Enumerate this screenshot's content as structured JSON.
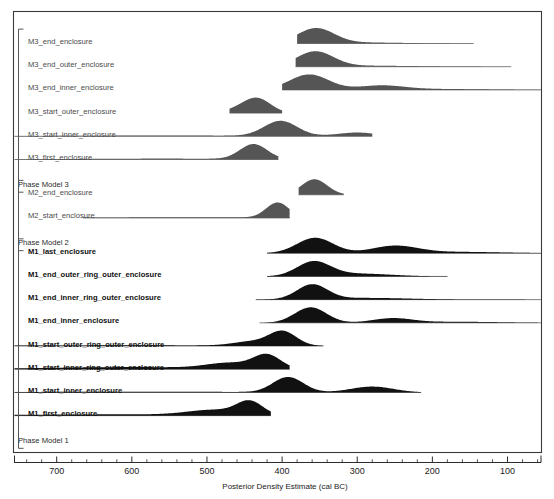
{
  "figure": {
    "width": 554,
    "height": 499,
    "background": "#ffffff"
  },
  "axis_title": "Posterior Density Estimate (cal BC)",
  "chart_data": {
    "type": "area",
    "title": "",
    "subtitle": "",
    "xlabel": "Posterior Density Estimate (cal BC)",
    "ylabel": "",
    "grid": false,
    "legend": null,
    "x_axis": {
      "label": "Posterior Density Estimate (cal BC)",
      "reversed": true,
      "xlim": [
        760,
        45
      ],
      "tick_labels": [
        "700",
        "600",
        "500",
        "400",
        "300",
        "200",
        "100"
      ],
      "tick_values": [
        700,
        600,
        500,
        400,
        300,
        200,
        100
      ],
      "minor_tick_interval": 20,
      "units": "cal BC"
    },
    "groups": [
      {
        "group_label": "Phase Model 3",
        "group_id": "phase-model-3",
        "ink": "#555555",
        "rows": [
          {
            "label": "M3_end_enclosure",
            "range": [
              380,
              145
            ],
            "modes": [
              {
                "center": 355,
                "height": 1.0,
                "width": 24
              },
              {
                "center": 300,
                "height": 0.07,
                "width": 60
              }
            ]
          },
          {
            "label": "M3_end_outer_enclosure",
            "range": [
              382,
              95
            ],
            "modes": [
              {
                "center": 356,
                "height": 1.0,
                "width": 24
              },
              {
                "center": 295,
                "height": 0.07,
                "width": 70
              }
            ]
          },
          {
            "label": "M3_end_inner_enclosure",
            "range": [
              400,
              40
            ],
            "modes": [
              {
                "center": 364,
                "height": 1.0,
                "width": 26
              },
              {
                "center": 268,
                "height": 0.26,
                "width": 30
              },
              {
                "center": 200,
                "height": 0.06,
                "width": 70
              }
            ]
          },
          {
            "label": "M3_start_outer_enclosure",
            "range": [
              470,
              400
            ],
            "modes": [
              {
                "center": 433,
                "height": 1.0,
                "width": 18
              },
              {
                "center": 460,
                "height": 0.22,
                "width": 18
              }
            ]
          },
          {
            "label": "M3_start_inner_enclosure",
            "range": [
              760,
              280
            ],
            "modes": [
              {
                "center": 402,
                "height": 1.0,
                "width": 22
              },
              {
                "center": 300,
                "height": 0.24,
                "width": 26
              },
              {
                "center": 560,
                "height": 0.05,
                "width": 140
              }
            ]
          },
          {
            "label": "M3_first_enclosure",
            "range": [
              760,
              405
            ],
            "modes": [
              {
                "center": 438,
                "height": 1.0,
                "width": 18
              },
              {
                "center": 560,
                "height": 0.06,
                "width": 130
              }
            ]
          }
        ]
      },
      {
        "group_label": "Phase Model 2",
        "group_id": "phase-model-2",
        "ink": "#555555",
        "rows": [
          {
            "label": "M2_end_enclosure",
            "range": [
              378,
              318
            ],
            "modes": [
              {
                "center": 357,
                "height": 1.0,
                "width": 17
              }
            ]
          },
          {
            "label": "M2_start_enclosure",
            "range": [
              665,
              390
            ],
            "modes": [
              {
                "center": 406,
                "height": 1.0,
                "width": 15
              },
              {
                "center": 520,
                "height": 0.05,
                "width": 120
              }
            ]
          }
        ]
      },
      {
        "group_label": "Phase Model 1",
        "group_id": "phase-model-1",
        "ink": "#111111",
        "rows": [
          {
            "label": "M1_last_enclosure",
            "range": [
              420,
              40
            ],
            "modes": [
              {
                "center": 356,
                "height": 1.0,
                "width": 24
              },
              {
                "center": 250,
                "height": 0.46,
                "width": 30
              },
              {
                "center": 170,
                "height": 0.09,
                "width": 60
              }
            ]
          },
          {
            "label": "M1_end_outer_ring_outer_enclosure",
            "range": [
              420,
              180
            ],
            "modes": [
              {
                "center": 358,
                "height": 1.0,
                "width": 22
              },
              {
                "center": 300,
                "height": 0.2,
                "width": 45
              }
            ]
          },
          {
            "label": "M1_end_inner_ring_outer_enclosure",
            "range": [
              435,
              40
            ],
            "modes": [
              {
                "center": 360,
                "height": 1.0,
                "width": 20
              },
              {
                "center": 290,
                "height": 0.12,
                "width": 60
              }
            ]
          },
          {
            "label": "M1_end_inner_enclosure",
            "range": [
              430,
              40
            ],
            "modes": [
              {
                "center": 362,
                "height": 1.0,
                "width": 21
              },
              {
                "center": 253,
                "height": 0.28,
                "width": 26
              },
              {
                "center": 170,
                "height": 0.07,
                "width": 60
              }
            ]
          },
          {
            "label": "M1_start_outer_ring_outer_enclosure",
            "range": [
              760,
              345
            ],
            "modes": [
              {
                "center": 399,
                "height": 1.0,
                "width": 18
              },
              {
                "center": 440,
                "height": 0.3,
                "width": 25
              },
              {
                "center": 600,
                "height": 0.05,
                "width": 150
              }
            ]
          },
          {
            "label": "M1_start_inner_ring_outer_enclosure",
            "range": [
              760,
              390
            ],
            "modes": [
              {
                "center": 420,
                "height": 1.0,
                "width": 18
              },
              {
                "center": 470,
                "height": 0.4,
                "width": 30
              },
              {
                "center": 600,
                "height": 0.16,
                "width": 120
              }
            ]
          },
          {
            "label": "M1_start_inner_enclosure",
            "range": [
              760,
              215
            ],
            "modes": [
              {
                "center": 392,
                "height": 1.0,
                "width": 20
              },
              {
                "center": 280,
                "height": 0.38,
                "width": 28
              },
              {
                "center": 600,
                "height": 0.05,
                "width": 150
              }
            ]
          },
          {
            "label": "M1_first_enclosure",
            "range": [
              760,
              415
            ],
            "modes": [
              {
                "center": 443,
                "height": 1.0,
                "width": 17
              },
              {
                "center": 490,
                "height": 0.4,
                "width": 35
              },
              {
                "center": 620,
                "height": 0.1,
                "width": 140
              }
            ]
          }
        ]
      }
    ]
  }
}
